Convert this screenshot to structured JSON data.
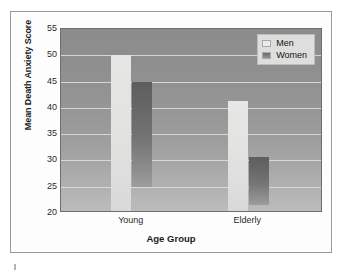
{
  "chart_data": {
    "type": "bar",
    "title": "",
    "xlabel": "Age Group",
    "ylabel": "Mean Death Anxiety Score",
    "categories": [
      "Young",
      "Elderly"
    ],
    "series": [
      {
        "name": "Men",
        "values": [
          50.0,
          41.3
        ],
        "color": "#e3e3e1"
      },
      {
        "name": "Women",
        "values": [
          45.0,
          30.7
        ],
        "color": "#6e6e6e"
      }
    ],
    "ylim": [
      20,
      55
    ],
    "yticks": [
      20,
      25,
      30,
      35,
      40,
      45,
      50,
      55
    ],
    "ytick_labels": [
      "20",
      "25",
      "30",
      "35",
      "40",
      "45",
      "50",
      "55"
    ],
    "grid": true,
    "grid_axis": "y",
    "legend_position": "top-right",
    "legend_entries": [
      "Men",
      "Women"
    ],
    "plot_background": "#9a9a9a",
    "annotations": []
  },
  "figure": {
    "frame_color": "#9a9a9a",
    "canvas_color": "#fdfdfd"
  }
}
